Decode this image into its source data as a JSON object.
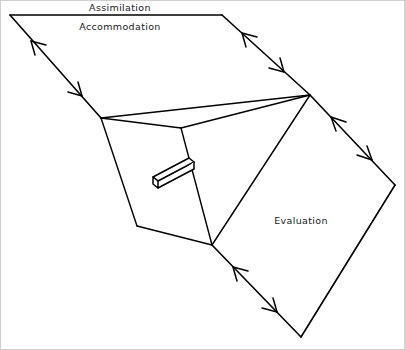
{
  "diagram": {
    "background_color": "#ffffff",
    "line_color": "#000000",
    "border_color": "#cfcfcf",
    "labels": [
      {
        "id": "assimilation",
        "text": "Assimilation",
        "x": 120,
        "y": 11
      },
      {
        "id": "accommodation",
        "text": "Accommodation",
        "x": 120,
        "y": 30
      },
      {
        "id": "evaluation",
        "text": "Evaluation",
        "x": 301,
        "y": 224
      }
    ],
    "vertices": {
      "top_left": {
        "x": 10,
        "y": 15
      },
      "top_right": {
        "x": 222,
        "y": 15
      },
      "hub_right": {
        "x": 310,
        "y": 95
      },
      "left_mid": {
        "x": 101,
        "y": 118
      },
      "fold_mid": {
        "x": 181,
        "y": 128
      },
      "left_low": {
        "x": 137,
        "y": 226
      },
      "hub_bottom": {
        "x": 212,
        "y": 245
      },
      "diamond_right": {
        "x": 395,
        "y": 185
      },
      "diamond_bottom": {
        "x": 301,
        "y": 337
      }
    },
    "edges": [
      {
        "id": "top-edge",
        "from": "top_left",
        "to": "top_right",
        "arrows": "none"
      },
      {
        "id": "upper-left-edge",
        "from": "top_left",
        "to": "left_mid",
        "arrows": "double"
      },
      {
        "id": "upper-right-edge",
        "from": "top_right",
        "to": "hub_right",
        "arrows": "double"
      },
      {
        "id": "fold-edge-direct",
        "from": "left_mid",
        "to": "hub_right",
        "arrows": "none"
      },
      {
        "id": "fold-edge-bent",
        "from": "left_mid",
        "via": "fold_mid",
        "to": "hub_right",
        "arrows": "none"
      },
      {
        "id": "left-face-edge",
        "from": "left_mid",
        "to": "left_low",
        "arrows": "none"
      },
      {
        "id": "left-base-edge",
        "from": "left_low",
        "to": "hub_bottom",
        "arrows": "none"
      },
      {
        "id": "inner-fold-edge",
        "from": "fold_mid",
        "to": "hub_bottom",
        "arrows": "none"
      },
      {
        "id": "diagonal-edge",
        "from": "hub_bottom",
        "to": "hub_right",
        "arrows": "none"
      },
      {
        "id": "eval-upper-right-edge",
        "from": "hub_right",
        "to": "diamond_right",
        "arrows": "double"
      },
      {
        "id": "eval-lower-right-edge",
        "from": "diamond_right",
        "to": "diamond_bottom",
        "arrows": "none"
      },
      {
        "id": "eval-lower-left-edge",
        "from": "hub_bottom",
        "to": "diamond_bottom",
        "arrows": "double"
      }
    ],
    "handle_bar": {
      "id": "protruding-bar",
      "description": "small 3D rectangular bar protruding from the inner face",
      "start": {
        "x": 152,
        "y": 182
      },
      "end": {
        "x": 190,
        "y": 162
      }
    },
    "arrow_style": {
      "type": "open-v",
      "stroke_width": 1.5,
      "description": "thin two-stroke V arrowheads, bidirectional along edges"
    }
  }
}
